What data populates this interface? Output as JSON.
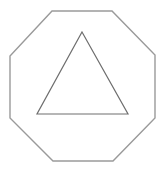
{
  "canvas": {
    "width": 166,
    "height": 171,
    "background": "#ffffff"
  },
  "shapes": {
    "octagon": {
      "points": "52,11 112,11 155,55 155,118 113,161 53,161 10,118 10,56",
      "stroke": "#9a9a9a",
      "stroke_width": 1.4
    },
    "triangle": {
      "points": "82,32 128,114 37,114",
      "stroke": "#6e6e6e",
      "stroke_width": 1.2
    }
  }
}
